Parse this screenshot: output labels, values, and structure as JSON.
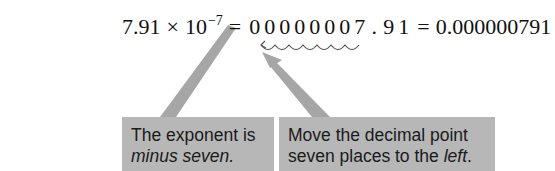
{
  "equation": {
    "mantissa": "7.91",
    "times": "×",
    "base": "10",
    "exponent": "−7",
    "equals_1": "=",
    "digits_before_point": [
      "0",
      "0",
      "0",
      "0",
      "0",
      "0",
      "0",
      "7"
    ],
    "decimal_point": ".",
    "digits_after_point": [
      "9",
      "1"
    ],
    "equals_2": "=",
    "result": "0.000000791"
  },
  "callouts": {
    "left": {
      "line1": "The exponent is",
      "line2_emphasis": "minus seven."
    },
    "right": {
      "line1": "Move the decimal point",
      "line2_prefix": "seven places to the ",
      "line2_emphasis": "left",
      "line2_suffix": "."
    }
  },
  "colors": {
    "callout_background": "#b7b7b7",
    "arrow_color": "#9a9a9a",
    "text_color": "#111111"
  }
}
